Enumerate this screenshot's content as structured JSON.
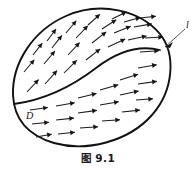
{
  "figure": {
    "caption": "图 9.1",
    "region_label": "D",
    "boundary_label": "l",
    "colors": {
      "stroke": "#111111",
      "arrow": "#1b1b1b",
      "background": "#ffffff"
    },
    "boundary_path": "M 13 95 C 12 62, 34 30, 66 16 C 100 1, 140 10, 160 34 C 176 54, 174 90, 152 115 C 128 142, 86 152, 54 143 C 27 135, 14 118, 13 95 Z",
    "inner_path": "M 14 104 C 44 100, 70 88, 96 68 C 118 51, 140 45, 160 50",
    "leader": {
      "line": "M 185 29 L 165 47",
      "head": "M 165 47 L 173 42 L 170 48 Z"
    },
    "labels": [
      {
        "name": "region-label-d",
        "text": "D",
        "x": 26,
        "y": 119
      },
      {
        "name": "boundary-label-l",
        "text": "l",
        "x": 186,
        "y": 28
      }
    ],
    "vectors": [
      {
        "x": 27,
        "y": 92,
        "len": 17,
        "angle": -47
      },
      {
        "x": 24,
        "y": 72,
        "len": 16,
        "angle": -50
      },
      {
        "x": 33,
        "y": 55,
        "len": 15,
        "angle": -52
      },
      {
        "x": 47,
        "y": 41,
        "len": 15,
        "angle": -53
      },
      {
        "x": 45,
        "y": 84,
        "len": 18,
        "angle": -48
      },
      {
        "x": 44,
        "y": 64,
        "len": 17,
        "angle": -50
      },
      {
        "x": 52,
        "y": 48,
        "len": 16,
        "angle": -52
      },
      {
        "x": 66,
        "y": 33,
        "len": 16,
        "angle": -50
      },
      {
        "x": 64,
        "y": 73,
        "len": 18,
        "angle": -45
      },
      {
        "x": 68,
        "y": 55,
        "len": 17,
        "angle": -47
      },
      {
        "x": 76,
        "y": 38,
        "len": 17,
        "angle": -46
      },
      {
        "x": 88,
        "y": 25,
        "len": 16,
        "angle": -42
      },
      {
        "x": 86,
        "y": 60,
        "len": 18,
        "angle": -38
      },
      {
        "x": 92,
        "y": 43,
        "len": 18,
        "angle": -38
      },
      {
        "x": 102,
        "y": 29,
        "len": 17,
        "angle": -33
      },
      {
        "x": 112,
        "y": 19,
        "len": 16,
        "angle": -26
      },
      {
        "x": 108,
        "y": 47,
        "len": 19,
        "angle": -25
      },
      {
        "x": 114,
        "y": 33,
        "len": 18,
        "angle": -22
      },
      {
        "x": 124,
        "y": 22,
        "len": 17,
        "angle": -15
      },
      {
        "x": 128,
        "y": 40,
        "len": 19,
        "angle": -12
      },
      {
        "x": 134,
        "y": 27,
        "len": 18,
        "angle": -10
      },
      {
        "x": 140,
        "y": 18,
        "len": 16,
        "angle": -6
      },
      {
        "x": 140,
        "y": 52,
        "len": 19,
        "angle": -4
      },
      {
        "x": 145,
        "y": 38,
        "len": 18,
        "angle": -3
      },
      {
        "x": 30,
        "y": 110,
        "len": 18,
        "angle": -8
      },
      {
        "x": 32,
        "y": 124,
        "len": 17,
        "angle": -6
      },
      {
        "x": 36,
        "y": 137,
        "len": 16,
        "angle": -10
      },
      {
        "x": 56,
        "y": 106,
        "len": 19,
        "angle": -10
      },
      {
        "x": 56,
        "y": 120,
        "len": 18,
        "angle": -6
      },
      {
        "x": 58,
        "y": 134,
        "len": 17,
        "angle": -6
      },
      {
        "x": 78,
        "y": 98,
        "len": 19,
        "angle": -14
      },
      {
        "x": 78,
        "y": 113,
        "len": 19,
        "angle": -8
      },
      {
        "x": 80,
        "y": 128,
        "len": 18,
        "angle": -4
      },
      {
        "x": 100,
        "y": 90,
        "len": 19,
        "angle": -16
      },
      {
        "x": 100,
        "y": 105,
        "len": 19,
        "angle": -10
      },
      {
        "x": 102,
        "y": 121,
        "len": 18,
        "angle": -4
      },
      {
        "x": 120,
        "y": 80,
        "len": 19,
        "angle": -18
      },
      {
        "x": 120,
        "y": 95,
        "len": 19,
        "angle": -12
      },
      {
        "x": 122,
        "y": 112,
        "len": 18,
        "angle": -6
      },
      {
        "x": 138,
        "y": 68,
        "len": 19,
        "angle": -10
      },
      {
        "x": 138,
        "y": 84,
        "len": 19,
        "angle": -8
      },
      {
        "x": 136,
        "y": 100,
        "len": 17,
        "angle": -4
      }
    ]
  }
}
